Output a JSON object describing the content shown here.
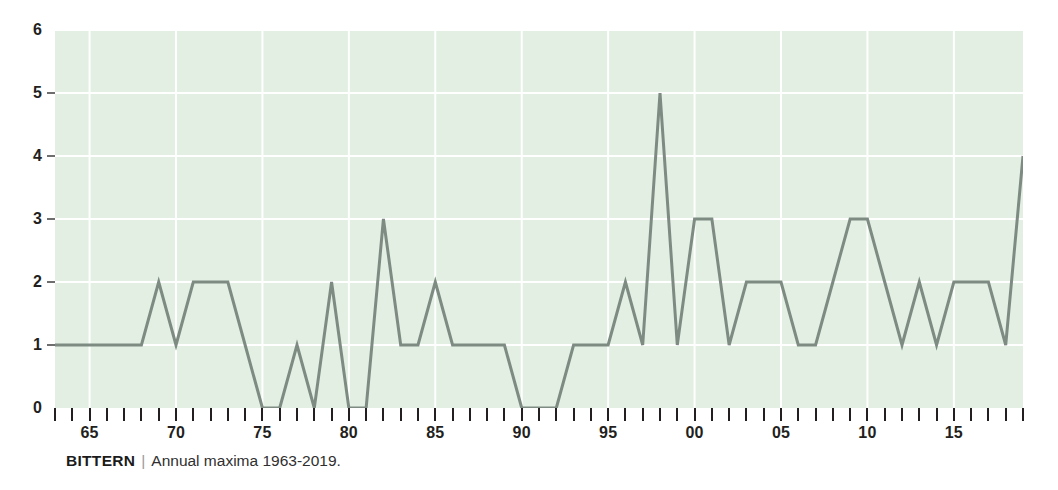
{
  "caption": {
    "species": "BITTERN",
    "separator": "|",
    "description": "Annual maxima 1963-2019."
  },
  "chart_data": {
    "type": "line",
    "title": "BITTERN",
    "subtitle": "Annual maxima 1963-2019.",
    "xlabel": "",
    "ylabel": "",
    "xlim": [
      1963,
      2019
    ],
    "ylim": [
      0,
      6
    ],
    "grid": true,
    "legend": null,
    "line_color": "#7d8b83",
    "plot_background": "#e2efe2",
    "gridline_color": "#ffffff",
    "y_ticks": [
      0,
      1,
      2,
      3,
      4,
      5,
      6
    ],
    "y_tick_labels": [
      "0",
      "1",
      "2",
      "3",
      "4",
      "5",
      "6"
    ],
    "x_tick_years": [
      1963,
      1964,
      1965,
      1966,
      1967,
      1968,
      1969,
      1970,
      1971,
      1972,
      1973,
      1974,
      1975,
      1976,
      1977,
      1978,
      1979,
      1980,
      1981,
      1982,
      1983,
      1984,
      1985,
      1986,
      1987,
      1988,
      1989,
      1990,
      1991,
      1992,
      1993,
      1994,
      1995,
      1996,
      1997,
      1998,
      1999,
      2000,
      2001,
      2002,
      2003,
      2004,
      2005,
      2006,
      2007,
      2008,
      2009,
      2010,
      2011,
      2012,
      2013,
      2014,
      2015,
      2016,
      2017,
      2018,
      2019
    ],
    "x_labeled_ticks": [
      {
        "year": 1965,
        "label": "65"
      },
      {
        "year": 1970,
        "label": "70"
      },
      {
        "year": 1975,
        "label": "75"
      },
      {
        "year": 1980,
        "label": "80"
      },
      {
        "year": 1985,
        "label": "85"
      },
      {
        "year": 1990,
        "label": "90"
      },
      {
        "year": 1995,
        "label": "95"
      },
      {
        "year": 2000,
        "label": "00"
      },
      {
        "year": 2005,
        "label": "05"
      },
      {
        "year": 2010,
        "label": "10"
      },
      {
        "year": 2015,
        "label": "15"
      }
    ],
    "x": [
      1963,
      1964,
      1965,
      1966,
      1967,
      1968,
      1969,
      1970,
      1971,
      1972,
      1973,
      1974,
      1975,
      1976,
      1977,
      1978,
      1979,
      1980,
      1981,
      1982,
      1983,
      1984,
      1985,
      1986,
      1987,
      1988,
      1989,
      1990,
      1991,
      1992,
      1993,
      1994,
      1995,
      1996,
      1997,
      1998,
      1999,
      2000,
      2001,
      2002,
      2003,
      2004,
      2005,
      2006,
      2007,
      2008,
      2009,
      2010,
      2011,
      2012,
      2013,
      2014,
      2015,
      2016,
      2017,
      2018,
      2019
    ],
    "values": [
      1,
      1,
      1,
      1,
      1,
      1,
      2,
      1,
      2,
      2,
      2,
      1,
      0,
      0,
      1,
      0,
      2,
      0,
      0,
      3,
      1,
      1,
      2,
      1,
      1,
      1,
      1,
      0,
      0,
      0,
      1,
      1,
      1,
      2,
      1,
      5,
      1,
      3,
      3,
      1,
      2,
      2,
      2,
      1,
      1,
      2,
      3,
      3,
      2,
      1,
      2,
      1,
      2,
      2,
      2,
      1,
      4
    ]
  }
}
